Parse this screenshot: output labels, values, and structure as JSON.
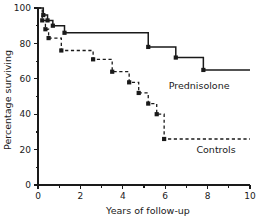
{
  "chart_data": {
    "type": "line",
    "title": "",
    "subtitle": "",
    "xlabel": "Years of follow-up",
    "ylabel": "Percentage surviving",
    "xlim": [
      0,
      10
    ],
    "ylim": [
      0,
      100
    ],
    "xticks": [
      0,
      2,
      4,
      6,
      8,
      10
    ],
    "xtick_labels": [
      "0",
      "2",
      "4",
      "6",
      "8",
      "10"
    ],
    "x_minor_ticks": [
      1,
      3,
      5,
      7,
      9
    ],
    "yticks": [
      0,
      20,
      40,
      60,
      80,
      100
    ],
    "ytick_labels": [
      "0",
      "20",
      "40",
      "60",
      "80",
      "100"
    ],
    "y_minor_ticks": [
      10,
      30,
      50,
      70,
      90
    ],
    "grid": false,
    "legend_position": "inline-right-of-curves",
    "series": [
      {
        "name": "Prednisolone",
        "style": "solid",
        "label_x": 7.6,
        "label_y": 54,
        "markers": true,
        "points": [
          {
            "x": 0.0,
            "y": 100
          },
          {
            "x": 0.25,
            "y": 100
          },
          {
            "x": 0.25,
            "y": 96
          },
          {
            "x": 0.45,
            "y": 96
          },
          {
            "x": 0.45,
            "y": 93
          },
          {
            "x": 0.7,
            "y": 93
          },
          {
            "x": 0.7,
            "y": 90
          },
          {
            "x": 1.25,
            "y": 90
          },
          {
            "x": 1.25,
            "y": 86
          },
          {
            "x": 5.2,
            "y": 86
          },
          {
            "x": 5.2,
            "y": 78
          },
          {
            "x": 6.5,
            "y": 78
          },
          {
            "x": 6.5,
            "y": 72
          },
          {
            "x": 7.8,
            "y": 72
          },
          {
            "x": 7.8,
            "y": 65
          },
          {
            "x": 10.0,
            "y": 65
          }
        ],
        "event_markers": [
          {
            "x": 0.25,
            "y": 96
          },
          {
            "x": 0.45,
            "y": 93
          },
          {
            "x": 0.7,
            "y": 90
          },
          {
            "x": 1.25,
            "y": 86
          },
          {
            "x": 5.2,
            "y": 78
          },
          {
            "x": 6.5,
            "y": 72
          },
          {
            "x": 7.8,
            "y": 65
          }
        ]
      },
      {
        "name": "Controls",
        "style": "dashed",
        "label_x": 8.4,
        "label_y": 18,
        "markers": true,
        "points": [
          {
            "x": 0.0,
            "y": 100
          },
          {
            "x": 0.2,
            "y": 100
          },
          {
            "x": 0.2,
            "y": 93
          },
          {
            "x": 0.35,
            "y": 93
          },
          {
            "x": 0.35,
            "y": 88
          },
          {
            "x": 0.5,
            "y": 88
          },
          {
            "x": 0.5,
            "y": 83
          },
          {
            "x": 1.1,
            "y": 83
          },
          {
            "x": 1.1,
            "y": 76
          },
          {
            "x": 2.6,
            "y": 76
          },
          {
            "x": 2.6,
            "y": 71
          },
          {
            "x": 3.5,
            "y": 71
          },
          {
            "x": 3.5,
            "y": 64
          },
          {
            "x": 4.3,
            "y": 64
          },
          {
            "x": 4.3,
            "y": 58
          },
          {
            "x": 4.75,
            "y": 58
          },
          {
            "x": 4.75,
            "y": 52
          },
          {
            "x": 5.2,
            "y": 52
          },
          {
            "x": 5.2,
            "y": 46
          },
          {
            "x": 5.6,
            "y": 46
          },
          {
            "x": 5.6,
            "y": 40
          },
          {
            "x": 5.95,
            "y": 40
          },
          {
            "x": 5.95,
            "y": 26
          },
          {
            "x": 10.0,
            "y": 26
          }
        ],
        "event_markers": [
          {
            "x": 0.2,
            "y": 93
          },
          {
            "x": 0.35,
            "y": 88
          },
          {
            "x": 0.5,
            "y": 83
          },
          {
            "x": 1.1,
            "y": 76
          },
          {
            "x": 2.6,
            "y": 71
          },
          {
            "x": 3.5,
            "y": 64
          },
          {
            "x": 4.3,
            "y": 58
          },
          {
            "x": 4.75,
            "y": 52
          },
          {
            "x": 5.2,
            "y": 46
          },
          {
            "x": 5.6,
            "y": 40
          },
          {
            "x": 5.95,
            "y": 26
          }
        ]
      }
    ],
    "colors": {
      "axis": "#1a1a1a",
      "curve": "#1a1a1a",
      "background": "#ffffff"
    }
  }
}
